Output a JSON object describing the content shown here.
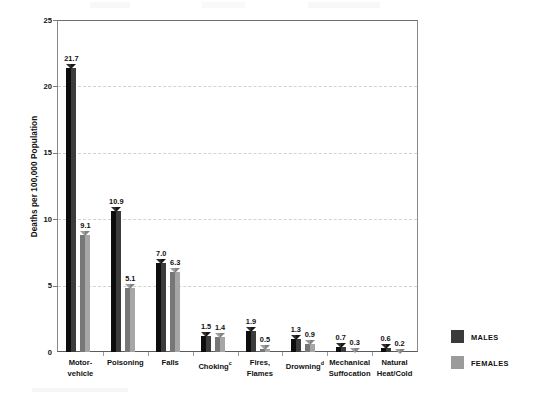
{
  "chart_data": {
    "type": "bar",
    "title": "",
    "xlabel": "",
    "ylabel": "Deaths per 100,000 Population",
    "ylim": [
      0,
      25
    ],
    "yticks": [
      0,
      5,
      10,
      15,
      20,
      25
    ],
    "ytick_labels": [
      "0",
      "5",
      "10",
      "15",
      "20",
      "25"
    ],
    "grid": "horizontal-dashed",
    "legend_position": "right",
    "categories": [
      "Motor-vehicle",
      "Poisoning",
      "Falls",
      "Choking",
      "Fires, Flames",
      "Drowning",
      "Mechanical Suffocation",
      "Natural Heat/Cold"
    ],
    "category_lines": [
      [
        "Motor-",
        "vehicle"
      ],
      [
        "Poisoning",
        ""
      ],
      [
        "Falls",
        ""
      ],
      [
        "Choking",
        ""
      ],
      [
        "Fires,",
        "Flames"
      ],
      [
        "Drowning",
        ""
      ],
      [
        "Mechanical",
        "Suffocation"
      ],
      [
        "Natural",
        "Heat/Cold"
      ]
    ],
    "category_footnotes": [
      "",
      "",
      "",
      "c",
      "",
      "d",
      "",
      ""
    ],
    "series": [
      {
        "name": "MALES",
        "color": "#1a1a1a",
        "values": [
          21.7,
          10.9,
          7.0,
          1.5,
          1.9,
          1.3,
          0.7,
          0.6
        ],
        "labels": [
          "21.7",
          "10.9",
          "7.0",
          "1.5",
          "1.9",
          "1.3",
          "0.7",
          "0.6"
        ]
      },
      {
        "name": "FEMALES",
        "color": "#9b9b9b",
        "values": [
          9.1,
          5.1,
          6.3,
          1.4,
          0.5,
          0.9,
          0.3,
          0.2
        ],
        "labels": [
          "9.1",
          "5.1",
          "6.3",
          "1.4",
          "0.5",
          "0.9",
          "0.3",
          "0.2"
        ]
      }
    ]
  },
  "legend": {
    "items": [
      {
        "label": "MALES",
        "swatch": "male"
      },
      {
        "label": "FEMALES",
        "swatch": "female"
      }
    ]
  }
}
